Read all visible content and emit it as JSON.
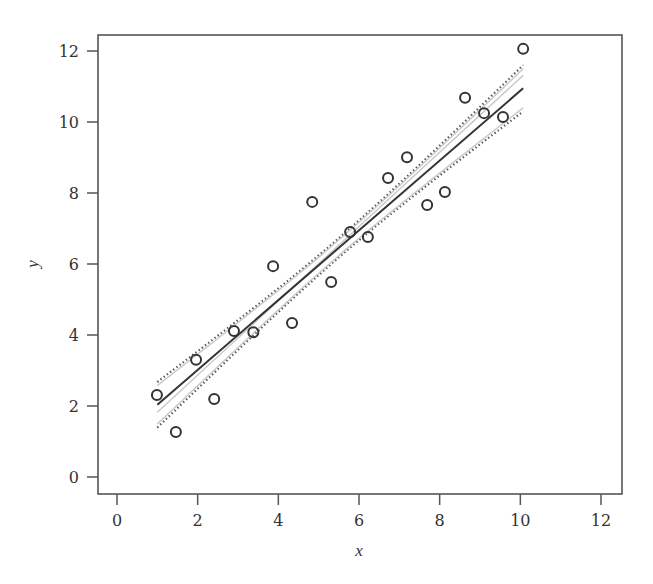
{
  "chart_data": {
    "type": "scatter",
    "title": "",
    "xlabel": "x",
    "ylabel": "y",
    "xlim": [
      -0.45,
      12.5
    ],
    "ylim": [
      -0.5,
      12.45
    ],
    "xticks": [
      0,
      2,
      4,
      6,
      8,
      10,
      12
    ],
    "yticks": [
      0,
      2,
      4,
      6,
      8,
      10,
      12
    ],
    "grid": false,
    "legend": null,
    "points": {
      "name": "observations",
      "marker": "open-circle",
      "x": [
        0.99,
        1.46,
        1.96,
        2.41,
        2.9,
        3.38,
        3.87,
        4.34,
        4.84,
        5.31,
        5.78,
        6.22,
        6.72,
        7.19,
        7.69,
        8.13,
        8.63,
        9.1,
        9.57,
        10.07
      ],
      "y": [
        2.31,
        1.27,
        3.3,
        2.2,
        4.11,
        4.08,
        5.94,
        4.34,
        7.75,
        5.49,
        6.9,
        6.76,
        8.42,
        9.01,
        7.66,
        8.03,
        10.68,
        10.25,
        10.14,
        12.06
      ]
    },
    "lines": [
      {
        "name": "fitted regression line",
        "style": "solid",
        "color": "#333333",
        "intercept": 1.05,
        "slope": 0.983,
        "x_range": [
          1.0,
          10.07
        ]
      },
      {
        "name": "true line",
        "style": "solid",
        "color": "#c8c8c8",
        "intercept": 0.78,
        "slope": 1.046,
        "x_range": [
          1.0,
          10.07
        ]
      }
    ],
    "bands": [
      {
        "name": "confidence band (fitted)",
        "style": "dotted",
        "color": "#555555",
        "center_intercept": 1.05,
        "center_slope": 0.983,
        "x_center": 5.5,
        "half_width_center": 0.27,
        "half_width_end": 0.65,
        "x_range": [
          1.0,
          10.07
        ]
      },
      {
        "name": "confidence band (light)",
        "style": "solid",
        "color": "#c8c8c8",
        "center_intercept": 1.05,
        "center_slope": 0.983,
        "x_center": 5.5,
        "half_width_center": 0.22,
        "half_width_end": 0.55,
        "x_range": [
          1.0,
          10.07
        ]
      }
    ]
  },
  "colors": {
    "axis": "#555555",
    "text": "#333333",
    "marker": "#333333",
    "fit_line": "#333333",
    "light_line": "#c8c8c8",
    "dotted_band": "#555555"
  },
  "layout": {
    "plot_box": {
      "left": 98,
      "top": 35,
      "right": 622,
      "bottom": 494
    },
    "x_px": {
      "v0": 117,
      "v12": 601
    },
    "y_px": {
      "v0": 477,
      "v12": 51
    }
  }
}
